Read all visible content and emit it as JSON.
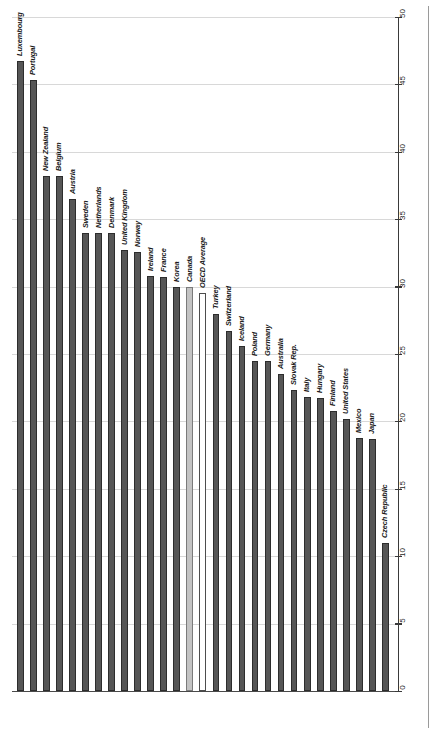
{
  "chart_data": {
    "type": "bar",
    "title": "",
    "subtitle": "",
    "xlabel": "",
    "ylabel": "",
    "ylim": [
      0,
      50
    ],
    "y_ticks": [
      0,
      5,
      10,
      15,
      20,
      25,
      30,
      35,
      40,
      45,
      50
    ],
    "grid": true,
    "grid_axis": "y",
    "legend": "none",
    "orientation": "vertical",
    "axis_position": "right",
    "label_rotation": -90,
    "categories": [
      "Luxembourg",
      "Portugal",
      "New Zealand",
      "Belgium",
      "Austria",
      "Sweden",
      "Netherlands",
      "Denmark",
      "United Kingdom",
      "Norway",
      "Ireland",
      "France",
      "Korea",
      "Canada",
      "OECD Average",
      "Turkey",
      "Switzerland",
      "Iceland",
      "Poland",
      "Germany",
      "Australia",
      "Slovak Rep.",
      "Italy",
      "Hungary",
      "Finland",
      "United States",
      "Mexico",
      "Japan",
      "Czech Republic"
    ],
    "values": [
      46.7,
      45.3,
      38.2,
      38.2,
      36.5,
      34.0,
      34.0,
      34.0,
      32.7,
      32.6,
      30.8,
      30.7,
      30.0,
      30.0,
      29.5,
      28.0,
      26.7,
      25.6,
      24.5,
      24.5,
      23.5,
      22.3,
      21.8,
      21.7,
      20.8,
      20.2,
      18.8,
      18.7,
      11.0
    ],
    "bar_styles": [
      "dark",
      "dark",
      "dark",
      "dark",
      "dark",
      "dark",
      "dark",
      "dark",
      "dark",
      "dark",
      "dark",
      "dark",
      "dark",
      "gray",
      "white",
      "dark",
      "dark",
      "dark",
      "dark",
      "dark",
      "dark",
      "dark",
      "dark",
      "dark",
      "dark",
      "dark",
      "dark",
      "dark",
      "dark"
    ],
    "colors": {
      "bar_dark": "#565656",
      "bar_gray": "#c3c3c3",
      "bar_white": "#ffffff",
      "bar_outline": "#2d2d2d",
      "gridline": "#d8d8d8",
      "axis": "#3a3a3a",
      "label_text": "#1a1a1a",
      "background": "#ffffff"
    }
  }
}
